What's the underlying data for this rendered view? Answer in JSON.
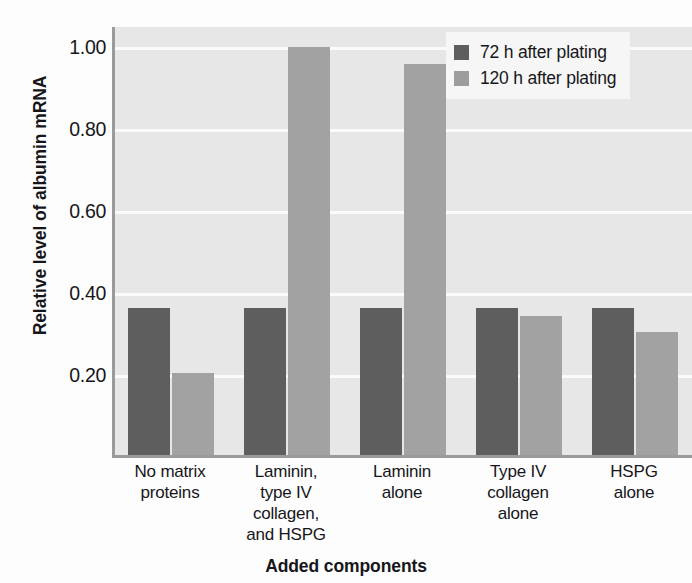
{
  "chart_data": {
    "type": "bar",
    "title": "",
    "xlabel": "Added components",
    "ylabel": "Relative level of albumin mRNA",
    "ylim": [
      0,
      1.05
    ],
    "yticks": [
      0.2,
      0.4,
      0.6,
      0.8,
      1.0
    ],
    "ytick_labels": [
      "0.20",
      "0.40",
      "0.60",
      "0.80",
      "1.00"
    ],
    "grid": true,
    "legend_position": "top-right",
    "categories": [
      "No matrix\nproteins",
      "Laminin,\ntype IV\ncollagen,\nand HSPG",
      "Laminin\nalone",
      "Type IV\ncollagen\nalone",
      "HSPG\nalone"
    ],
    "category_lines": [
      [
        "No matrix",
        "proteins"
      ],
      [
        "Laminin,",
        "type IV",
        "collagen,",
        "and HSPG"
      ],
      [
        "Laminin",
        "alone"
      ],
      [
        "Type IV",
        "collagen",
        "alone"
      ],
      [
        "HSPG",
        "alone"
      ]
    ],
    "series": [
      {
        "name": "72 h after plating",
        "color": "#5e5e5e",
        "values": [
          0.365,
          0.365,
          0.365,
          0.365,
          0.365
        ]
      },
      {
        "name": "120 h after plating",
        "color": "#a2a2a2",
        "values": [
          0.205,
          1.0,
          0.96,
          0.345,
          0.305
        ]
      }
    ]
  },
  "legend": {
    "entries": [
      {
        "label": "72 h after plating",
        "color": "#5e5e5e"
      },
      {
        "label": "120 h after plating",
        "color": "#9d9d9d"
      }
    ]
  },
  "axes": {
    "y_title": "Relative level of albumin mRNA",
    "x_title": "Added components",
    "y_tick_labels": [
      "1.00",
      "0.80",
      "0.60",
      "0.40",
      "0.20"
    ]
  },
  "colors": {
    "plot_background": "#e7e7e7",
    "gridline": "#fbfbfb",
    "axis_line": "#9a9a9a",
    "series_72h": "#5e5e5e",
    "series_120h": "#a2a2a2",
    "text": "#16161a",
    "legend_background": "#f6f6f6"
  }
}
